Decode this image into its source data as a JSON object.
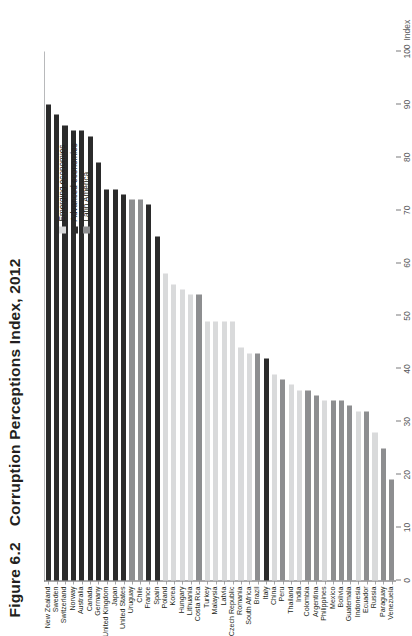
{
  "figure": {
    "number": "Figure 6.2",
    "title": "Corruption Perceptions Index, 2012"
  },
  "axis": {
    "name": "Index",
    "ticks": [
      "0",
      "10",
      "20",
      "30",
      "40",
      "50",
      "60",
      "70",
      "80",
      "90",
      "100"
    ]
  },
  "legend": {
    "items": [
      {
        "label": "Emerging economies",
        "color": "#d9dadb",
        "key": "emg"
      },
      {
        "label": "Advanced economies",
        "color": "#2b2b2b",
        "key": "adv"
      },
      {
        "label": "Latin America",
        "color": "#8d8e90",
        "key": "lat"
      }
    ]
  },
  "chart_data": {
    "type": "bar",
    "title": "Corruption Perceptions Index, 2012",
    "xlabel": "Index",
    "ylabel": "",
    "xlim": [
      0,
      100
    ],
    "grid": false,
    "orientation": "horizontal",
    "legend_position": "top-right",
    "categories": [
      "New Zealand",
      "Sweden",
      "Switzerland",
      "Norway",
      "Australia",
      "Canada",
      "Germany",
      "United Kingdom",
      "Japan",
      "United States",
      "Uruguay",
      "Chile",
      "France",
      "Spain",
      "Poland",
      "Korea",
      "Hungary",
      "Lithuania",
      "Costa Rica",
      "Turkey",
      "Malaysia",
      "Latvia",
      "Czech Republic",
      "Romania",
      "South Africa",
      "Brazil",
      "Italy",
      "China",
      "Peru",
      "Thailand",
      "India",
      "Colombia",
      "Argentina",
      "Philippines",
      "Mexico",
      "Bolivia",
      "Guatemala",
      "Indonesia",
      "Ecuador",
      "Russia",
      "Paraguay",
      "Venezuela"
    ],
    "values": [
      90,
      88,
      86,
      85,
      85,
      84,
      79,
      74,
      74,
      73,
      72,
      72,
      71,
      65,
      58,
      56,
      55,
      54,
      54,
      49,
      49,
      49,
      49,
      44,
      43,
      43,
      42,
      39,
      38,
      37,
      36,
      36,
      35,
      34,
      34,
      34,
      33,
      32,
      32,
      28,
      25,
      19
    ],
    "groups": [
      "adv",
      "adv",
      "adv",
      "adv",
      "adv",
      "adv",
      "adv",
      "adv",
      "adv",
      "adv",
      "lat",
      "lat",
      "adv",
      "adv",
      "emg",
      "emg",
      "emg",
      "emg",
      "lat",
      "emg",
      "emg",
      "emg",
      "emg",
      "emg",
      "emg",
      "lat",
      "adv",
      "emg",
      "lat",
      "emg",
      "emg",
      "lat",
      "lat",
      "emg",
      "lat",
      "lat",
      "lat",
      "emg",
      "lat",
      "emg",
      "lat",
      "lat"
    ],
    "series": [
      {
        "name": "Corruption Perceptions Index 2012",
        "values": [
          90,
          88,
          86,
          85,
          85,
          84,
          79,
          74,
          74,
          73,
          72,
          72,
          71,
          65,
          58,
          56,
          55,
          54,
          54,
          49,
          49,
          49,
          49,
          44,
          43,
          43,
          42,
          39,
          38,
          37,
          36,
          36,
          35,
          34,
          34,
          34,
          33,
          32,
          32,
          28,
          25,
          19
        ]
      }
    ]
  }
}
